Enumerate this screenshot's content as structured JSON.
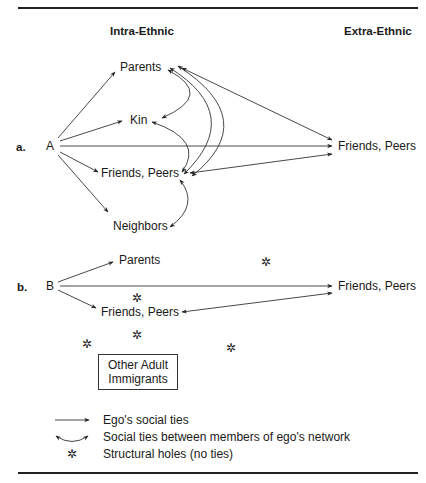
{
  "headers": {
    "intra": "Intra-Ethnic",
    "extra": "Extra-Ethnic"
  },
  "panel_a": {
    "label": "a.",
    "ego": "A",
    "nodes": {
      "parents": "Parents",
      "kin": "Kin",
      "friends_intra": "Friends, Peers",
      "neighbors": "Neighbors",
      "friends_extra": "Friends, Peers"
    }
  },
  "panel_b": {
    "label": "b.",
    "ego": "B",
    "nodes": {
      "parents": "Parents",
      "friends_intra": "Friends, Peers",
      "friends_extra": "Friends, Peers",
      "other_adults_line1": "Other Adult",
      "other_adults_line2": "Immigrants"
    },
    "structural_hole_symbol": "✲"
  },
  "legend": {
    "ego_ties": "Ego's social ties",
    "network_ties": "Social ties between members of ego's network",
    "structural_holes": "Structural holes (no ties)",
    "star_symbol": "✲"
  }
}
